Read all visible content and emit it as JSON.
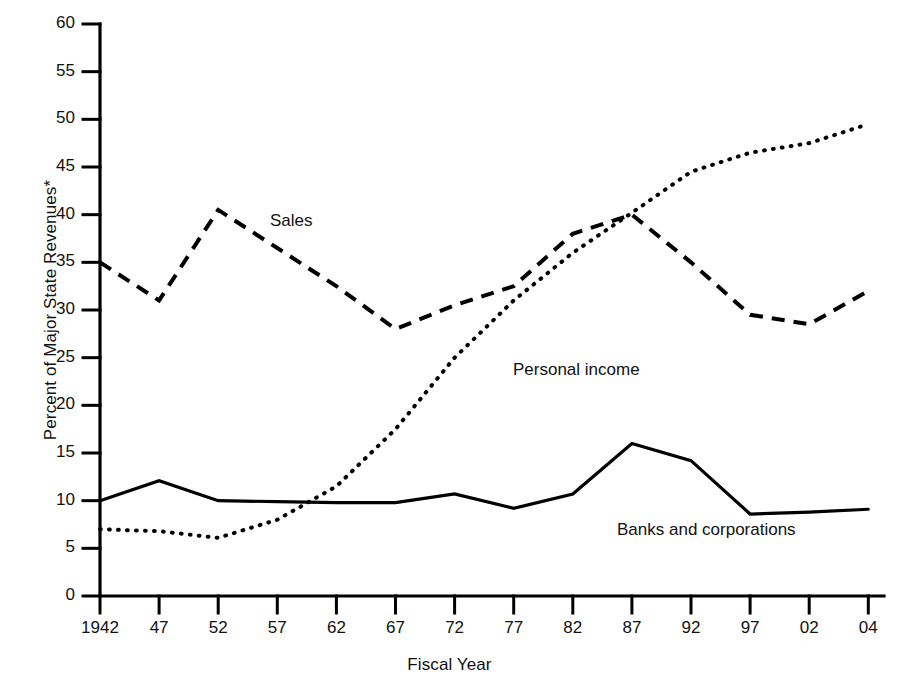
{
  "chart_data": {
    "type": "line",
    "title": "",
    "xlabel": "Fiscal Year",
    "ylabel": "Percent of Major State Revenues*",
    "categories": [
      "1942",
      "47",
      "52",
      "57",
      "62",
      "67",
      "72",
      "77",
      "82",
      "87",
      "92",
      "97",
      "02",
      "04"
    ],
    "ylim": [
      0,
      60
    ],
    "yticks": [
      0,
      5,
      10,
      15,
      20,
      25,
      30,
      35,
      40,
      45,
      50,
      55,
      60
    ],
    "ytick_labels": [
      "0",
      "5",
      "10",
      "15",
      "20",
      "25",
      "30",
      "35",
      "40",
      "45",
      "50",
      "55",
      "60"
    ],
    "grid": false,
    "legend": "inline-annotations",
    "series": [
      {
        "name": "Sales",
        "style": "dashed",
        "label_x": "52",
        "values": [
          35.0,
          31.0,
          40.5,
          36.5,
          32.5,
          28.0,
          30.5,
          32.5,
          38.0,
          40.0,
          35.0,
          29.5,
          28.5,
          32.0
        ]
      },
      {
        "name": "Personal income",
        "style": "dotted",
        "label_x": "77",
        "values": [
          7.0,
          6.8,
          6.1,
          8.0,
          11.5,
          17.5,
          25.0,
          31.0,
          36.0,
          40.2,
          44.5,
          46.5,
          47.5,
          49.5
        ]
      },
      {
        "name": "Banks and corporations",
        "style": "solid",
        "label_x": "87",
        "values": [
          10.0,
          12.1,
          10.0,
          9.9,
          9.8,
          9.8,
          10.7,
          9.2,
          10.7,
          16.0,
          14.2,
          8.6,
          8.8,
          9.1
        ]
      }
    ]
  },
  "annotations": {
    "sales_label": "Sales",
    "personal_income_label": "Personal income",
    "banks_label": "Banks and corporations"
  },
  "axes": {
    "y_title": "Percent of Major State Revenues*",
    "x_title": "Fiscal Year"
  }
}
